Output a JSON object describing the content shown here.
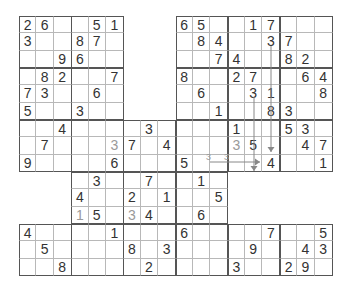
{
  "puzzle": {
    "type": "overlapping-sudoku",
    "rows": 15,
    "cols": 18,
    "cell_w": 17.39,
    "cell_h": 17.33,
    "colors": {
      "digit": "#333333",
      "pencil": "#9a9a9a",
      "thin_line": "#b8b8b8",
      "thick_line": "#555555",
      "arrow": "#888888"
    },
    "active_rows": [
      {
        "row": 0,
        "ranges": [
          [
            0,
            5
          ],
          [
            9,
            17
          ]
        ]
      },
      {
        "row": 1,
        "ranges": [
          [
            0,
            5
          ],
          [
            9,
            17
          ]
        ]
      },
      {
        "row": 2,
        "ranges": [
          [
            0,
            5
          ],
          [
            9,
            17
          ]
        ]
      },
      {
        "row": 3,
        "ranges": [
          [
            0,
            5
          ],
          [
            9,
            17
          ]
        ]
      },
      {
        "row": 4,
        "ranges": [
          [
            0,
            5
          ],
          [
            9,
            17
          ]
        ]
      },
      {
        "row": 5,
        "ranges": [
          [
            0,
            5
          ],
          [
            9,
            17
          ]
        ]
      },
      {
        "row": 6,
        "ranges": [
          [
            0,
            17
          ]
        ]
      },
      {
        "row": 7,
        "ranges": [
          [
            0,
            17
          ]
        ]
      },
      {
        "row": 8,
        "ranges": [
          [
            0,
            17
          ]
        ]
      },
      {
        "row": 9,
        "ranges": [
          [
            3,
            11
          ]
        ]
      },
      {
        "row": 10,
        "ranges": [
          [
            3,
            11
          ]
        ]
      },
      {
        "row": 11,
        "ranges": [
          [
            3,
            11
          ]
        ]
      },
      {
        "row": 12,
        "ranges": [
          [
            0,
            17
          ]
        ]
      },
      {
        "row": 13,
        "ranges": [
          [
            0,
            17
          ]
        ]
      },
      {
        "row": 14,
        "ranges": [
          [
            0,
            17
          ]
        ]
      }
    ],
    "digits": [
      {
        "r": 0,
        "c": 0,
        "v": "2"
      },
      {
        "r": 0,
        "c": 1,
        "v": "6"
      },
      {
        "r": 0,
        "c": 4,
        "v": "5"
      },
      {
        "r": 0,
        "c": 5,
        "v": "1"
      },
      {
        "r": 0,
        "c": 9,
        "v": "6"
      },
      {
        "r": 0,
        "c": 10,
        "v": "5"
      },
      {
        "r": 0,
        "c": 13,
        "v": "1"
      },
      {
        "r": 0,
        "c": 14,
        "v": "7"
      },
      {
        "r": 1,
        "c": 0,
        "v": "3"
      },
      {
        "r": 1,
        "c": 3,
        "v": "8"
      },
      {
        "r": 1,
        "c": 4,
        "v": "7"
      },
      {
        "r": 1,
        "c": 10,
        "v": "8"
      },
      {
        "r": 1,
        "c": 11,
        "v": "4"
      },
      {
        "r": 1,
        "c": 14,
        "v": "3"
      },
      {
        "r": 1,
        "c": 15,
        "v": "7"
      },
      {
        "r": 2,
        "c": 2,
        "v": "9"
      },
      {
        "r": 2,
        "c": 3,
        "v": "6"
      },
      {
        "r": 2,
        "c": 11,
        "v": "7"
      },
      {
        "r": 2,
        "c": 12,
        "v": "4"
      },
      {
        "r": 2,
        "c": 15,
        "v": "8"
      },
      {
        "r": 2,
        "c": 16,
        "v": "2"
      },
      {
        "r": 3,
        "c": 1,
        "v": "8"
      },
      {
        "r": 3,
        "c": 2,
        "v": "2"
      },
      {
        "r": 3,
        "c": 5,
        "v": "7"
      },
      {
        "r": 3,
        "c": 9,
        "v": "8"
      },
      {
        "r": 3,
        "c": 12,
        "v": "2"
      },
      {
        "r": 3,
        "c": 13,
        "v": "7"
      },
      {
        "r": 3,
        "c": 16,
        "v": "6"
      },
      {
        "r": 3,
        "c": 17,
        "v": "4"
      },
      {
        "r": 4,
        "c": 0,
        "v": "7"
      },
      {
        "r": 4,
        "c": 1,
        "v": "3"
      },
      {
        "r": 4,
        "c": 4,
        "v": "6"
      },
      {
        "r": 4,
        "c": 10,
        "v": "6"
      },
      {
        "r": 4,
        "c": 13,
        "v": "3"
      },
      {
        "r": 4,
        "c": 14,
        "v": "1"
      },
      {
        "r": 4,
        "c": 17,
        "v": "8"
      },
      {
        "r": 5,
        "c": 0,
        "v": "5"
      },
      {
        "r": 5,
        "c": 3,
        "v": "3"
      },
      {
        "r": 5,
        "c": 11,
        "v": "1"
      },
      {
        "r": 5,
        "c": 14,
        "v": "8"
      },
      {
        "r": 5,
        "c": 15,
        "v": "3"
      },
      {
        "r": 6,
        "c": 2,
        "v": "4"
      },
      {
        "r": 6,
        "c": 7,
        "v": "3"
      },
      {
        "r": 6,
        "c": 12,
        "v": "1"
      },
      {
        "r": 6,
        "c": 15,
        "v": "5"
      },
      {
        "r": 6,
        "c": 16,
        "v": "3"
      },
      {
        "r": 7,
        "c": 1,
        "v": "7"
      },
      {
        "r": 7,
        "c": 5,
        "v": "3",
        "pencil": true
      },
      {
        "r": 7,
        "c": 6,
        "v": "7"
      },
      {
        "r": 7,
        "c": 8,
        "v": "4"
      },
      {
        "r": 7,
        "c": 12,
        "v": "3",
        "pencil": true
      },
      {
        "r": 7,
        "c": 13,
        "v": "5"
      },
      {
        "r": 7,
        "c": 16,
        "v": "4"
      },
      {
        "r": 7,
        "c": 17,
        "v": "7"
      },
      {
        "r": 8,
        "c": 0,
        "v": "9"
      },
      {
        "r": 8,
        "c": 5,
        "v": "6"
      },
      {
        "r": 8,
        "c": 9,
        "v": "5"
      },
      {
        "r": 8,
        "c": 14,
        "v": "4"
      },
      {
        "r": 8,
        "c": 17,
        "v": "1"
      },
      {
        "r": 9,
        "c": 4,
        "v": "3"
      },
      {
        "r": 9,
        "c": 7,
        "v": "7"
      },
      {
        "r": 9,
        "c": 10,
        "v": "1"
      },
      {
        "r": 10,
        "c": 3,
        "v": "4"
      },
      {
        "r": 10,
        "c": 6,
        "v": "2"
      },
      {
        "r": 10,
        "c": 8,
        "v": "1"
      },
      {
        "r": 10,
        "c": 11,
        "v": "5"
      },
      {
        "r": 11,
        "c": 3,
        "v": "1",
        "pencil": true
      },
      {
        "r": 11,
        "c": 4,
        "v": "5"
      },
      {
        "r": 11,
        "c": 6,
        "v": "3",
        "pencil": true
      },
      {
        "r": 11,
        "c": 7,
        "v": "4"
      },
      {
        "r": 11,
        "c": 10,
        "v": "6"
      },
      {
        "r": 12,
        "c": 0,
        "v": "4"
      },
      {
        "r": 12,
        "c": 5,
        "v": "1"
      },
      {
        "r": 12,
        "c": 9,
        "v": "6"
      },
      {
        "r": 12,
        "c": 14,
        "v": "7"
      },
      {
        "r": 12,
        "c": 17,
        "v": "5"
      },
      {
        "r": 13,
        "c": 1,
        "v": "5"
      },
      {
        "r": 13,
        "c": 6,
        "v": "8"
      },
      {
        "r": 13,
        "c": 8,
        "v": "3"
      },
      {
        "r": 13,
        "c": 13,
        "v": "9"
      },
      {
        "r": 13,
        "c": 16,
        "v": "4"
      },
      {
        "r": 13,
        "c": 17,
        "v": "3"
      },
      {
        "r": 14,
        "c": 2,
        "v": "8"
      },
      {
        "r": 14,
        "c": 7,
        "v": "2"
      },
      {
        "r": 14,
        "c": 12,
        "v": "3"
      },
      {
        "r": 14,
        "c": 15,
        "v": "2"
      },
      {
        "r": 14,
        "c": 16,
        "v": "9"
      }
    ],
    "notes": [
      {
        "x": 206,
        "y": 153,
        "v": "3"
      },
      {
        "x": 224,
        "y": 153,
        "v": "3"
      }
    ],
    "arrows": [
      {
        "name": "arrow-col14-down",
        "x1": 271,
        "y1": 46,
        "x2": 271,
        "y2": 152,
        "dir": "down"
      },
      {
        "name": "arrow-col13-down",
        "x1": 254,
        "y1": 97,
        "x2": 254,
        "y2": 171,
        "dir": "down"
      },
      {
        "name": "arrow-row8-right",
        "x1": 210,
        "y1": 162,
        "x2": 260,
        "y2": 162,
        "dir": "right"
      }
    ]
  }
}
